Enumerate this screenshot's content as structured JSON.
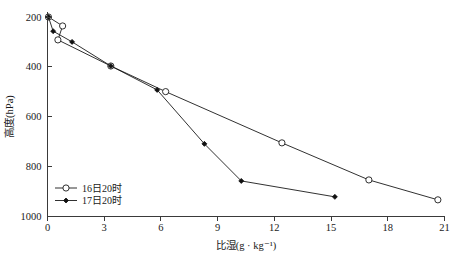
{
  "chart_data": {
    "type": "line",
    "title": "",
    "xlabel": "比湿(g · kg⁻¹)",
    "ylabel": "高度(hPa)",
    "xlim": [
      0,
      21
    ],
    "ylim": [
      1000,
      200
    ],
    "y_inverted": true,
    "grid": false,
    "legend_position": "bottom-left",
    "xticks": [
      0,
      3,
      6,
      9,
      12,
      15,
      18,
      21
    ],
    "xticklabels": [
      "0",
      "3",
      "6",
      "9",
      "12",
      "15",
      "18",
      "21"
    ],
    "yticks": [
      200,
      400,
      600,
      800,
      1000
    ],
    "yticklabels": [
      "200",
      "400",
      "600",
      "800",
      "1000"
    ],
    "series": [
      {
        "name": "16日20时",
        "marker": "open-circle",
        "color": "#1a1a1a",
        "points": [
          {
            "x": 0.05,
            "y": 200
          },
          {
            "x": 0.8,
            "y": 236
          },
          {
            "x": 0.55,
            "y": 292
          },
          {
            "x": 3.35,
            "y": 397
          },
          {
            "x": 6.25,
            "y": 500
          },
          {
            "x": 12.4,
            "y": 706
          },
          {
            "x": 17.0,
            "y": 855
          },
          {
            "x": 20.65,
            "y": 935
          }
        ]
      },
      {
        "name": "17日20时",
        "marker": "filled-diamond",
        "color": "#111111",
        "points": [
          {
            "x": 0.05,
            "y": 200
          },
          {
            "x": 0.3,
            "y": 257
          },
          {
            "x": 1.3,
            "y": 300
          },
          {
            "x": 3.35,
            "y": 397
          },
          {
            "x": 5.8,
            "y": 493
          },
          {
            "x": 8.3,
            "y": 710
          },
          {
            "x": 10.25,
            "y": 859
          },
          {
            "x": 15.2,
            "y": 923
          }
        ]
      }
    ]
  },
  "legend": {
    "entries": [
      {
        "label": "16日20时",
        "marker": "open-circle"
      },
      {
        "label": "17日20时",
        "marker": "filled-diamond"
      }
    ]
  }
}
